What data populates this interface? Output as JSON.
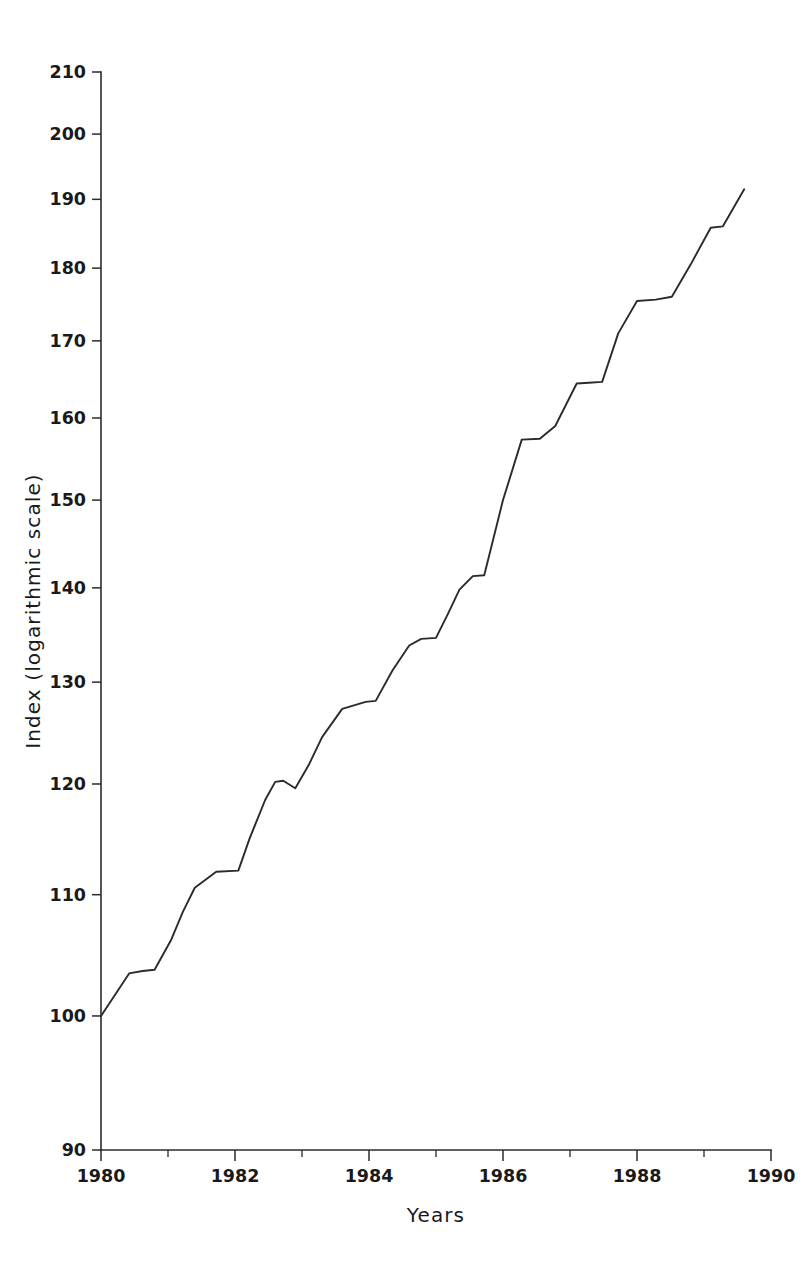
{
  "chart_data": {
    "type": "line",
    "title": "",
    "xlabel": "Years",
    "ylabel": "Index (logarithmic scale)",
    "yscale": "log",
    "xscale": "linear",
    "xlim": [
      1980,
      1990
    ],
    "ylim": [
      90,
      210
    ],
    "grid": false,
    "legend": null,
    "y_ticks": [
      90,
      100,
      110,
      120,
      130,
      140,
      150,
      160,
      170,
      180,
      190,
      200,
      210
    ],
    "y_tick_labels": [
      "90",
      "100",
      "110",
      "120",
      "130",
      "140",
      "150",
      "160",
      "170",
      "180",
      "190",
      "200",
      "210"
    ],
    "x_ticks_major": [
      1980,
      1982,
      1984,
      1986,
      1988,
      1990
    ],
    "x_tick_labels": [
      "1980",
      "1982",
      "1984",
      "1986",
      "1988",
      "1990"
    ],
    "x_ticks_minor": [
      1981,
      1983,
      1985,
      1987,
      1989
    ],
    "line_color": "#2b2b2b",
    "series": [
      {
        "name": "Index",
        "x": [
          1980.0,
          1980.42,
          1980.62,
          1980.8,
          1981.05,
          1981.22,
          1981.4,
          1981.72,
          1982.05,
          1982.22,
          1982.45,
          1982.6,
          1982.72,
          1982.9,
          1983.1,
          1983.3,
          1983.6,
          1983.95,
          1984.1,
          1984.35,
          1984.6,
          1984.78,
          1985.0,
          1985.18,
          1985.35,
          1985.55,
          1985.72,
          1986.0,
          1986.28,
          1986.55,
          1986.78,
          1987.1,
          1987.28,
          1987.48,
          1987.72,
          1988.0,
          1988.28,
          1988.52,
          1988.8,
          1989.1,
          1989.28,
          1989.6
        ],
        "y": [
          100.0,
          103.4,
          103.6,
          103.7,
          106.2,
          108.5,
          110.6,
          112.0,
          112.1,
          115.0,
          118.5,
          120.2,
          120.3,
          119.6,
          121.8,
          124.5,
          127.3,
          128.0,
          128.1,
          131.2,
          133.8,
          134.5,
          134.6,
          137.2,
          139.8,
          141.3,
          141.4,
          150.0,
          157.3,
          157.4,
          159.0,
          164.4,
          164.5,
          164.6,
          171.0,
          175.4,
          175.6,
          176.0,
          180.5,
          185.8,
          186.0,
          191.5
        ]
      }
    ],
    "annotations": []
  },
  "axis": {
    "x_title": "Years",
    "y_title": "Index (logarithmic scale)"
  }
}
